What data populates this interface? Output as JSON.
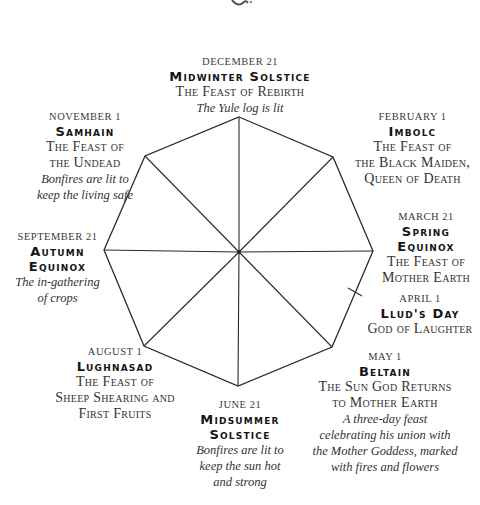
{
  "ornament": "decorative-flourish",
  "festivals": [
    {
      "id": "midwinter",
      "date": "DECEMBER 21",
      "name": "Midwinter Solstice",
      "feast": [
        "The Feast of Rebirth"
      ],
      "note": [
        "The Yule log is lit"
      ]
    },
    {
      "id": "imbolc",
      "date": "FEBRUARY 1",
      "name": "Imbolc",
      "feast": [
        "The Feast of",
        "the Black Maiden,",
        "Queen of Death"
      ],
      "note": []
    },
    {
      "id": "spring",
      "date": "MARCH 21",
      "name": [
        "Spring",
        "Equinox"
      ],
      "feast": [
        "The Feast of",
        "Mother Earth"
      ],
      "note": []
    },
    {
      "id": "llud",
      "date": "APRIL 1",
      "name": "Llud's Day",
      "feast": [
        "God of Laughter"
      ],
      "note": []
    },
    {
      "id": "beltain",
      "date": "MAY 1",
      "name": "Beltain",
      "feast": [
        "The Sun God Returns",
        "to Mother Earth"
      ],
      "note": [
        "A three-day feast",
        "celebrating his union with",
        "the Mother Goddess, marked",
        "with fires and flowers"
      ]
    },
    {
      "id": "midsummer",
      "date": "JUNE 21",
      "name": [
        "Midsummer",
        "Solstice"
      ],
      "feast": [],
      "note": [
        "Bonfires are lit to",
        "keep the sun hot",
        "and strong"
      ]
    },
    {
      "id": "lughnasad",
      "date": "AUGUST 1",
      "name": "Lughnasad",
      "feast": [
        "The Feast of",
        "Sheep Shearing and",
        "First Fruits"
      ],
      "note": []
    },
    {
      "id": "autumn",
      "date": "SEPTEMBER 21",
      "name": [
        "Autumn",
        "Equinox"
      ],
      "feast": [],
      "note": [
        "The in-gathering",
        "of crops"
      ]
    },
    {
      "id": "samhain",
      "date": "NOVEMBER 1",
      "name": "Samhain",
      "feast": [
        "The Feast of",
        "the Undead"
      ],
      "note": [
        "Bonfires are lit to",
        "keep the living safe"
      ]
    }
  ],
  "wheel": {
    "center": [
      239,
      252
    ],
    "vertices": [
      [
        239,
        117
      ],
      [
        333,
        157
      ],
      [
        373,
        251
      ],
      [
        332,
        347
      ],
      [
        238,
        386
      ],
      [
        144,
        346
      ],
      [
        104,
        250
      ],
      [
        145,
        156
      ]
    ],
    "tick": [
      355,
      292
    ],
    "stroke": "#2a2a2a"
  }
}
